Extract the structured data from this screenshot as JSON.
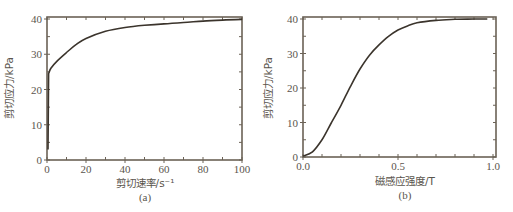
{
  "figure": {
    "panels": [
      {
        "id": "a",
        "panel_label": "(a)",
        "xlabel": "剪切速率/s⁻¹",
        "ylabel": "剪切应力/kPa",
        "xticks": [
          "0",
          "20",
          "40",
          "60",
          "80",
          "100"
        ],
        "yticks": [
          "0",
          "10",
          "20",
          "30",
          "40"
        ]
      },
      {
        "id": "b",
        "panel_label": "(b)",
        "xlabel": "磁感应强度/T",
        "ylabel": "剪切应力/kPa",
        "xticks": [
          "0.0",
          "0.5",
          "1.0"
        ],
        "yticks": [
          "0",
          "10",
          "20",
          "30",
          "40"
        ]
      }
    ],
    "colors": {
      "curve": "#3b342c",
      "frame": "#6b6256",
      "text": "#5a554d"
    }
  },
  "chart_data": [
    {
      "type": "line",
      "title": "",
      "panel": "(a)",
      "xlabel": "剪切速率/s⁻¹",
      "ylabel": "剪切应力/kPa",
      "xlim": [
        0,
        100
      ],
      "ylim": [
        0,
        41
      ],
      "xticks": [
        0,
        20,
        40,
        60,
        80,
        100
      ],
      "yticks": [
        0,
        10,
        20,
        30,
        40
      ],
      "grid": false,
      "legend": null,
      "series": [
        {
          "name": "shear stress vs shear rate",
          "x": [
            0.5,
            0.8,
            2,
            5,
            10,
            15,
            20,
            30,
            40,
            50,
            60,
            70,
            80,
            90,
            100
          ],
          "y": [
            3.0,
            24.5,
            26.0,
            28.0,
            30.5,
            32.8,
            34.5,
            36.5,
            37.6,
            38.2,
            38.6,
            39.0,
            39.4,
            39.7,
            39.9
          ]
        }
      ]
    },
    {
      "type": "line",
      "title": "",
      "panel": "(b)",
      "xlabel": "磁感应强度/T",
      "ylabel": "剪切应力/kPa",
      "xlim": [
        0,
        1.0
      ],
      "ylim": [
        0,
        41
      ],
      "xticks": [
        0.0,
        0.5,
        1.0
      ],
      "yticks": [
        0,
        10,
        20,
        30,
        40
      ],
      "grid": false,
      "legend": null,
      "series": [
        {
          "name": "shear stress vs magnetic induction",
          "x": [
            0.0,
            0.05,
            0.1,
            0.15,
            0.2,
            0.25,
            0.3,
            0.35,
            0.4,
            0.45,
            0.5,
            0.55,
            0.6,
            0.7,
            0.8,
            0.9,
            0.97
          ],
          "y": [
            0.3,
            1.5,
            5.0,
            10.0,
            15.0,
            20.5,
            25.5,
            29.5,
            32.5,
            35.0,
            36.8,
            38.0,
            38.9,
            39.6,
            39.9,
            40.0,
            40.0
          ]
        }
      ]
    }
  ]
}
